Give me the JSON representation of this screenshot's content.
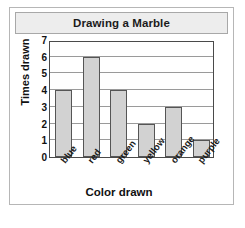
{
  "chart_data": {
    "type": "bar",
    "title": "Drawing a Marble",
    "xlabel": "Color drawn",
    "ylabel": "Times drawn",
    "categories": [
      "blue",
      "red",
      "green",
      "yellow",
      "orange",
      "purple"
    ],
    "values": [
      4,
      6,
      4,
      2,
      3,
      1
    ],
    "ylim": [
      0,
      7
    ],
    "ytick_labels": [
      "0",
      "1",
      "2",
      "3",
      "4",
      "5",
      "6",
      "7"
    ],
    "ytick_values": [
      0,
      1,
      2,
      3,
      4,
      5,
      6,
      7
    ],
    "grid": "horizontal",
    "legend": "none",
    "bar_fill_color": "#d2d2d2",
    "bar_edge_color": "#555555",
    "title_banner_color": "#ededed",
    "frame_color": "#4a4a4a"
  }
}
